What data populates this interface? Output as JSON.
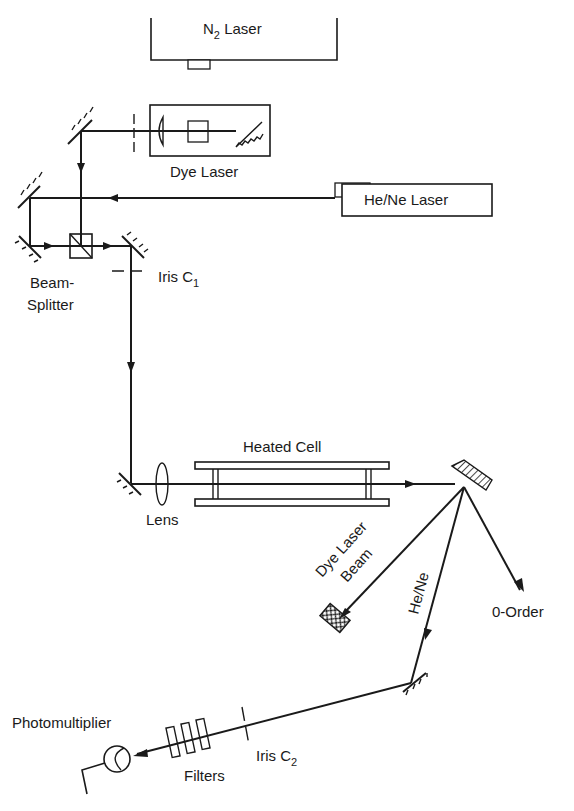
{
  "diagram": {
    "type": "optical-setup",
    "colors": {
      "ink": "#1a1a1a",
      "background": "#ffffff"
    },
    "components": {
      "n2_laser": {
        "label_main": "N",
        "label_sub": "2",
        "label_rest": " Laser"
      },
      "dye_laser": {
        "label": "Dye Laser"
      },
      "hene_laser": {
        "label": "He/Ne Laser"
      },
      "beam_splitter": {
        "label_line1": "Beam-",
        "label_line2": "Splitter"
      },
      "iris_c1": {
        "label_main": "Iris C",
        "label_sub": "1"
      },
      "heated_cell": {
        "label": "Heated Cell"
      },
      "lens": {
        "label": "Lens"
      },
      "dye_laser_beam": {
        "label_line1": "Dye Laser",
        "label_line2": "Beam"
      },
      "hene_beam": {
        "label": "He/Ne"
      },
      "zero_order": {
        "label": "0-Order"
      },
      "iris_c2": {
        "label_main": "Iris C",
        "label_sub": "2"
      },
      "filters": {
        "label": "Filters"
      },
      "photomultiplier": {
        "label": "Photomultiplier"
      }
    }
  }
}
